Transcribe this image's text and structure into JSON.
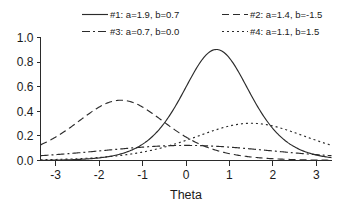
{
  "chart_data": {
    "type": "line",
    "title": "",
    "xlabel": "Theta",
    "ylabel": "",
    "xlim": [
      -3.35,
      3.35
    ],
    "ylim": [
      0.0,
      1.0
    ],
    "grid": false,
    "legend_position": "top",
    "x_ticks": [
      "-3",
      "-2",
      "-1",
      "0",
      "1",
      "2",
      "3"
    ],
    "x_tick_values": [
      -3,
      -2,
      -1,
      0,
      1,
      2,
      3
    ],
    "y_ticks": [
      "0.0",
      "0.2",
      "0.4",
      "0.6",
      "0.8",
      "1.0"
    ],
    "y_tick_values": [
      0.0,
      0.2,
      0.4,
      0.6,
      0.8,
      1.0
    ],
    "x": [
      -3.3,
      -3.0,
      -2.7,
      -2.4,
      -2.1,
      -1.8,
      -1.5,
      -1.2,
      -0.9,
      -0.6,
      -0.3,
      0.0,
      0.3,
      0.6,
      0.9,
      1.2,
      1.5,
      1.8,
      2.1,
      2.4,
      2.7,
      3.0,
      3.3
    ],
    "series": [
      {
        "name": "#1:  a=1.9, b=0.7",
        "label": "#1:  a=1.9, b=0.7",
        "a": 1.9,
        "b": 0.7,
        "linestyle": "solid",
        "dasharray": "",
        "peak_x": 0.7,
        "peak_y": 0.9025,
        "values": [
          0.0,
          0.001,
          0.001,
          0.002,
          0.004,
          0.007,
          0.012,
          0.021,
          0.037,
          0.063,
          0.105,
          0.169,
          0.261,
          0.378,
          0.504,
          0.61,
          0.669,
          0.667,
          0.61,
          0.517,
          0.411,
          0.309,
          0.222
        ]
      },
      {
        "name": "#2:  a=1.4, b=-1.5",
        "label": "#2:  a=1.4, b=-1.5",
        "a": 1.4,
        "b": -1.5,
        "linestyle": "dashed",
        "dasharray": "7,4",
        "peak_x": -1.5,
        "peak_y": 0.49,
        "values": [
          0.16,
          0.219,
          0.286,
          0.352,
          0.408,
          0.451,
          0.476,
          0.481,
          0.466,
          0.433,
          0.386,
          0.33,
          0.271,
          0.214,
          0.163,
          0.12,
          0.086,
          0.06,
          0.042,
          0.028,
          0.019,
          0.013,
          0.008
        ]
      },
      {
        "name": "#3:  a=0.7, b=0.0",
        "label": "#3:  a=0.7, b=0.0",
        "a": 0.7,
        "b": 0.0,
        "linestyle": "dashdot",
        "dasharray": "8,3,2,3",
        "peak_x": 0.0,
        "peak_y": 0.1225,
        "values": [
          0.045,
          0.053,
          0.062,
          0.071,
          0.08,
          0.089,
          0.097,
          0.105,
          0.112,
          0.117,
          0.121,
          0.123,
          0.121,
          0.117,
          0.112,
          0.105,
          0.097,
          0.089,
          0.08,
          0.071,
          0.062,
          0.053,
          0.045
        ]
      },
      {
        "name": "#4:  a=1.1, b=1.5",
        "label": "#4:  a=1.1, b=1.5",
        "a": 1.1,
        "b": 1.5,
        "linestyle": "dotted",
        "dasharray": "2,3",
        "peak_x": 1.5,
        "peak_y": 0.3025,
        "values": [
          0.009,
          0.012,
          0.017,
          0.023,
          0.031,
          0.042,
          0.057,
          0.076,
          0.099,
          0.127,
          0.159,
          0.193,
          0.226,
          0.256,
          0.28,
          0.295,
          0.301,
          0.295,
          0.28,
          0.256,
          0.226,
          0.193,
          0.159
        ]
      }
    ]
  },
  "colors": {
    "axis": "#2b2b2b",
    "curve": "#2b2b2b",
    "text": "#1a1a1a",
    "background": "#ffffff"
  }
}
